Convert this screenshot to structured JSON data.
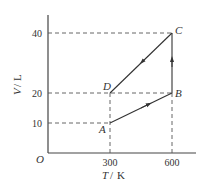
{
  "diagram": {
    "type": "V-T graph",
    "x_axis": {
      "label_var": "T",
      "label_unit": "K",
      "ticks": [
        "300",
        "600"
      ]
    },
    "y_axis": {
      "label_var": "V",
      "label_unit": "L",
      "ticks": [
        "10",
        "20",
        "40"
      ]
    },
    "origin_label": "O",
    "points": [
      {
        "name": "A",
        "T": 300,
        "V": 10
      },
      {
        "name": "B",
        "T": 600,
        "V": 20
      },
      {
        "name": "C",
        "T": 600,
        "V": 40
      },
      {
        "name": "D",
        "T": 300,
        "V": 20
      }
    ],
    "process": [
      "A→B",
      "B→C",
      "C→D"
    ],
    "colors": {
      "line": "#333333",
      "dash": "#444444"
    }
  }
}
